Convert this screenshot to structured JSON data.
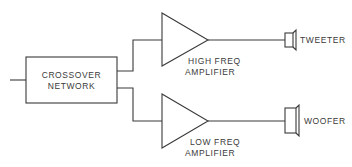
{
  "diagram": {
    "type": "block-diagram",
    "colors": {
      "line": "#3a3a3a",
      "background": "#ffffff"
    },
    "crossover": {
      "line1": "CROSSOVER",
      "line2": "NETWORK"
    },
    "high_amp": {
      "line1": "HIGH FREQ",
      "line2": "AMPLIFIER"
    },
    "low_amp": {
      "line1": "LOW FREQ",
      "line2": "AMPLIFIER"
    },
    "tweeter": {
      "label": "TWEETER"
    },
    "woofer": {
      "label": "WOOFER"
    }
  }
}
